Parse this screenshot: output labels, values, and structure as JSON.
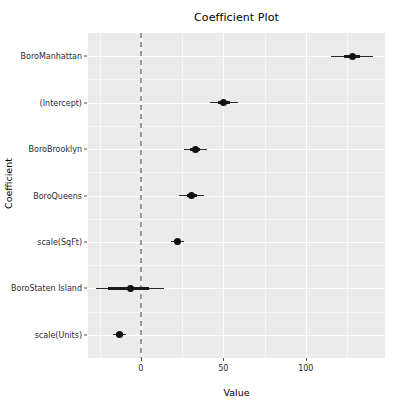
{
  "chart_data": {
    "type": "scatter",
    "subtype": "coefficient-forest-plot",
    "title": "Coefficient Plot",
    "xlabel": "Value",
    "ylabel": "Coefficient",
    "xlim": [
      -32,
      148
    ],
    "x_ticks": [
      0,
      50,
      100
    ],
    "x_tick_labels": [
      "0",
      "50",
      "100"
    ],
    "grid": true,
    "legend": "none",
    "reference_line": {
      "value": 0,
      "style": "dashed",
      "color": "#9a9a9a"
    },
    "panel_background": "#EBEBEB",
    "point_color": "#111111",
    "categories": [
      "BoroManhattan",
      "(Intercept)",
      "BoroBrooklyn",
      "BoroQueens",
      "scale(SqFt)",
      "BoroStaten Island",
      "scale(Units)"
    ],
    "points": [
      {
        "label": "BoroManhattan",
        "estimate": 128,
        "inner_low": 123,
        "inner_high": 133,
        "outer_low": 115,
        "outer_high": 141
      },
      {
        "label": "(Intercept)",
        "estimate": 50,
        "inner_low": 47,
        "inner_high": 54,
        "outer_low": 42,
        "outer_high": 59
      },
      {
        "label": "BoroBrooklyn",
        "estimate": 33,
        "inner_low": 30,
        "inner_high": 36,
        "outer_low": 26,
        "outer_high": 40
      },
      {
        "label": "BoroQueens",
        "estimate": 31,
        "inner_low": 28,
        "inner_high": 34,
        "outer_low": 23,
        "outer_high": 38
      },
      {
        "label": "scale(SqFt)",
        "estimate": 22,
        "inner_low": 20,
        "inner_high": 24,
        "outer_low": 18,
        "outer_high": 26
      },
      {
        "label": "BoroStaten Island",
        "estimate": -6,
        "inner_low": -20,
        "inner_high": 5,
        "outer_low": -27,
        "outer_high": 14
      },
      {
        "label": "scale(Units)",
        "estimate": -13,
        "inner_low": -15,
        "inner_high": -11,
        "outer_low": -17,
        "outer_high": -9
      }
    ]
  }
}
